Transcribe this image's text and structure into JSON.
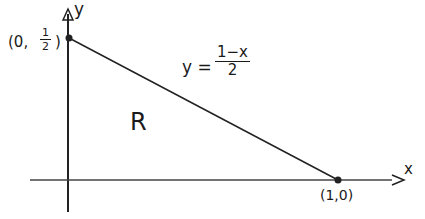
{
  "diagram": {
    "region_label": "R",
    "axes": {
      "x_label": "x",
      "y_label": "y"
    },
    "points": [
      {
        "label_prefix": "(0,",
        "label_frac_num": "1",
        "label_frac_den": "2",
        "label_suffix": ")"
      },
      {
        "label": "(1,0)"
      }
    ],
    "line_equation": {
      "lhs": "y =",
      "numerator": "1−x",
      "denominator": "2"
    },
    "colors": {
      "ink": "#1a1a1a",
      "background": "#ffffff"
    }
  }
}
